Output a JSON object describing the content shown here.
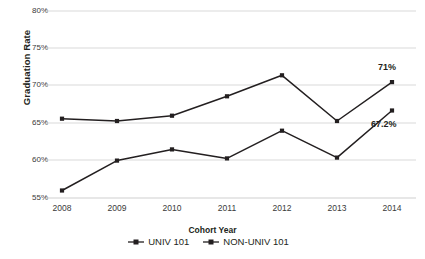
{
  "chart_data": {
    "type": "line",
    "title": "",
    "xlabel": "Cohort Year",
    "ylabel": "Graduation Rate",
    "categories": [
      "2008",
      "2009",
      "2010",
      "2011",
      "2012",
      "2013",
      "2014"
    ],
    "x": [
      2008,
      2009,
      2010,
      2011,
      2012,
      2013,
      2014
    ],
    "ylim": [
      55,
      80
    ],
    "yticks": [
      "55%",
      "60%",
      "65%",
      "70%",
      "75%",
      "80%"
    ],
    "ytick_values": [
      55,
      60,
      65,
      70,
      75,
      80
    ],
    "grid": "horizontal",
    "legend_position": "bottom-right",
    "series": [
      {
        "name": "UNIV 101",
        "values": [
          65.6,
          65.3,
          66.0,
          68.6,
          71.4,
          65.3,
          70.5
        ],
        "color": "#231f20",
        "marker": "square"
      },
      {
        "name": "NON-UNIV 101",
        "values": [
          56.0,
          60.0,
          61.5,
          60.3,
          64.0,
          60.4,
          66.7
        ],
        "color": "#231f20",
        "marker": "square"
      }
    ],
    "annotations": [
      {
        "text": "71%",
        "series": "UNIV 101",
        "x": "2014",
        "value": 70.5
      },
      {
        "text": "67.2%",
        "series": "NON-UNIV 101",
        "x": "2014",
        "value": 66.7
      }
    ]
  },
  "axis": {
    "y_title": "Graduation Rate",
    "x_title": "Cohort Year",
    "y_ticks": [
      "80%",
      "75%",
      "70%",
      "65%",
      "60%",
      "55%"
    ],
    "x_ticks": [
      "2008",
      "2009",
      "2010",
      "2011",
      "2012",
      "2013",
      "2014"
    ]
  },
  "legend": {
    "items": [
      {
        "label": "UNIV 101"
      },
      {
        "label": "NON-UNIV 101"
      }
    ]
  },
  "annotations": {
    "univ_2014": "71%",
    "nonuniv_2014": "67.2%"
  },
  "colors": {
    "series": "#231f20",
    "grid": "#d9d9d9",
    "tick_text": "#3a3a3a",
    "background": "#ffffff"
  }
}
